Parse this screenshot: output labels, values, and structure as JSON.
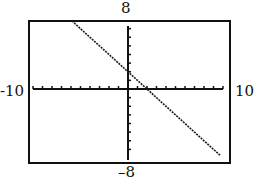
{
  "chart_data": {
    "type": "line",
    "title": "",
    "xlabel": "",
    "ylabel": "",
    "xlim": [
      -10,
      10
    ],
    "ylim": [
      -8,
      8
    ],
    "x_tick_step": 1,
    "y_tick_step": 1,
    "grid": false,
    "window_labels": {
      "ymax": "8",
      "ymin": "–8",
      "xmin": "-10",
      "xmax": "10"
    },
    "series": [
      {
        "name": "y = -x + 2",
        "slope": -1,
        "intercept": 2,
        "x": [
          -5.9,
          -4,
          -2,
          0,
          2,
          4,
          6,
          8,
          9.7
        ],
        "y": [
          7.9,
          6,
          4,
          2,
          0,
          -2,
          -4,
          -6,
          -7.7
        ]
      }
    ],
    "colors": {
      "line": "#1a1a1a",
      "axes": "#111111",
      "frame": "#111111"
    }
  },
  "labels": {
    "top": "8",
    "bottom": "–8",
    "left": "-10",
    "right": "10"
  }
}
